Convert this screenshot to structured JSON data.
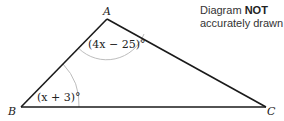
{
  "diagram": {
    "type": "triangle",
    "vertices": {
      "A": {
        "label": "A",
        "x": 107,
        "y": 19
      },
      "B": {
        "label": "B",
        "x": 21,
        "y": 107
      },
      "C": {
        "label": "C",
        "x": 266,
        "y": 107
      }
    },
    "angles": {
      "A": {
        "label": "(4x − 25)°"
      },
      "B": {
        "label": "(x + 3)°"
      }
    },
    "note": {
      "prefix": "Diagram ",
      "emphasis": "NOT",
      "line2": "accurately drawn"
    },
    "colors": {
      "edge": "#1a1a1a",
      "arc": "#bdbdbd",
      "text": "#222222"
    }
  }
}
